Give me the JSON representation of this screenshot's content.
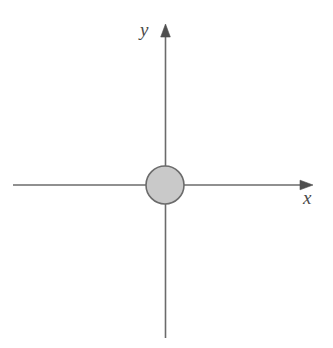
{
  "figure": {
    "width": 333,
    "height": 348,
    "background_color": "#ffffff"
  },
  "labels": {
    "y_axis": "y",
    "x_axis": "x"
  },
  "chart_data": {
    "type": "scatter",
    "title": "",
    "xlabel": "x",
    "ylabel": "y",
    "grid": false,
    "legend": false,
    "origin_px": [
      165,
      185
    ],
    "axes": {
      "x_axis": {
        "label": "x",
        "orientation": "horizontal",
        "start_px": [
          13,
          185
        ],
        "end_px": [
          313,
          185
        ],
        "arrow_at": "end",
        "color": "#6b6b6b",
        "line_width": 1.6
      },
      "y_axis": {
        "label": "y",
        "orientation": "vertical",
        "start_px": [
          165,
          338
        ],
        "end_px": [
          165,
          24
        ],
        "arrow_at": "end",
        "color": "#6b6b6b",
        "line_width": 1.6
      }
    },
    "shapes": [
      {
        "kind": "circle",
        "center": [
          165,
          185
        ],
        "radius": 19,
        "fill": "#c9c9c9",
        "stroke": "#6b6b6b",
        "stroke_width": 1.6
      }
    ]
  },
  "colors": {
    "axis": "#6b6b6b",
    "label_text": "#4a4a4a",
    "disc_fill": "#c9c9c9",
    "disc_stroke": "#6b6b6b",
    "background": "#ffffff"
  }
}
